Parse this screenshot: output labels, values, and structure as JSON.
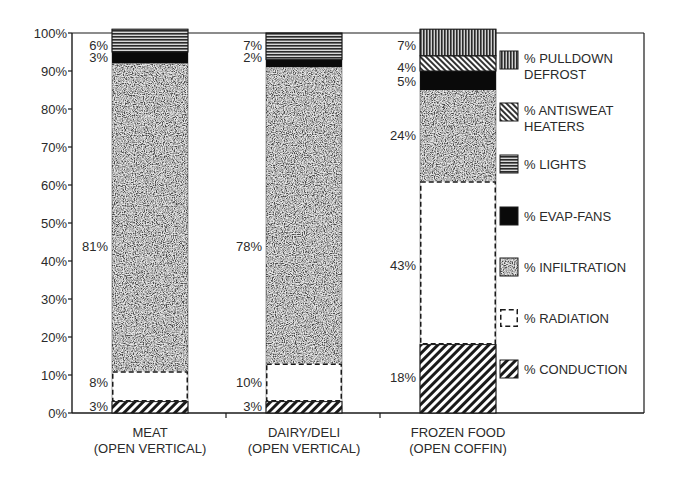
{
  "chart_data": {
    "type": "bar",
    "stacked": true,
    "title": "",
    "xlabel": "",
    "ylabel": "",
    "ylim": [
      0,
      100
    ],
    "y_ticks": [
      "0%",
      "10%",
      "20%",
      "30%",
      "40%",
      "50%",
      "60%",
      "70%",
      "80%",
      "90%",
      "100%"
    ],
    "grid": false,
    "legend_position": "right",
    "categories": [
      {
        "line1": "MEAT",
        "line2": "(OPEN VERTICAL)"
      },
      {
        "line1": "DAIRY/DELI",
        "line2": "(OPEN VERTICAL)"
      },
      {
        "line1": "FROZEN FOOD",
        "line2": "(OPEN COFFIN)"
      }
    ],
    "series": [
      {
        "name": "% CONDUCTION",
        "pattern": "diag-down",
        "values": [
          3,
          3,
          18
        ]
      },
      {
        "name": "% RADIATION",
        "pattern": "dashed-outline",
        "values": [
          8,
          10,
          43
        ]
      },
      {
        "name": "% INFILTRATION",
        "pattern": "speckle",
        "values": [
          81,
          78,
          24
        ]
      },
      {
        "name": "% EVAP-FANS",
        "pattern": "solid-black",
        "values": [
          3,
          2,
          5
        ]
      },
      {
        "name": "% LIGHTS",
        "pattern": "horizontal-lines",
        "values": [
          6,
          7,
          0
        ]
      },
      {
        "name": "% ANTISWEAT HEATERS",
        "pattern": "diag-up",
        "values": [
          0,
          0,
          4
        ]
      },
      {
        "name": "% PULLDOWN DEFROST",
        "pattern": "vertical-lines",
        "values": [
          0,
          0,
          7
        ]
      }
    ],
    "data_labels": [
      [
        "3%",
        "8%",
        "81%",
        "3%",
        "6%"
      ],
      [
        "3%",
        "10%",
        "78%",
        "2%",
        "7%"
      ],
      [
        "18%",
        "43%",
        "24%",
        "5%",
        "4%",
        "7%"
      ]
    ]
  },
  "legend": [
    {
      "line1": "% PULLDOWN",
      "line2": "DEFROST",
      "pattern": "vertical-lines"
    },
    {
      "line1": "% ANTISWEAT",
      "line2": "HEATERS",
      "pattern": "diag-up"
    },
    {
      "line1": "% LIGHTS",
      "line2": "",
      "pattern": "horizontal-lines"
    },
    {
      "line1": "% EVAP-FANS",
      "line2": "",
      "pattern": "solid-black"
    },
    {
      "line1": "% INFILTRATION",
      "line2": "",
      "pattern": "speckle"
    },
    {
      "line1": "% RADIATION",
      "line2": "",
      "pattern": "dashed-outline"
    },
    {
      "line1": "% CONDUCTION",
      "line2": "",
      "pattern": "diag-down"
    }
  ],
  "colors": {
    "ink": "#1a1a1a",
    "text": "#2a2a2a",
    "background": "#ffffff"
  }
}
